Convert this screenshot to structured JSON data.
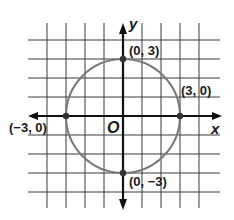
{
  "chart_data": {
    "type": "scatter",
    "title": "",
    "xlabel": "x",
    "ylabel": "y",
    "origin_label": "O",
    "xlim": [
      -4,
      4
    ],
    "ylim": [
      -4,
      4
    ],
    "grid": true,
    "grid_step": 1,
    "shapes": [
      {
        "type": "circle",
        "center": [
          0,
          0
        ],
        "radius": 3
      }
    ],
    "points": [
      {
        "x": 0,
        "y": 3,
        "label": "(0, 3)"
      },
      {
        "x": 3,
        "y": 0,
        "label": "(3, 0)"
      },
      {
        "x": -3,
        "y": 0,
        "label": "(−3, 0)"
      },
      {
        "x": 0,
        "y": -3,
        "label": "(0, −3)"
      }
    ]
  },
  "colors": {
    "grid": "#3a3a3a",
    "axis": "#111111",
    "circle": "#777777",
    "point": "#333333"
  }
}
